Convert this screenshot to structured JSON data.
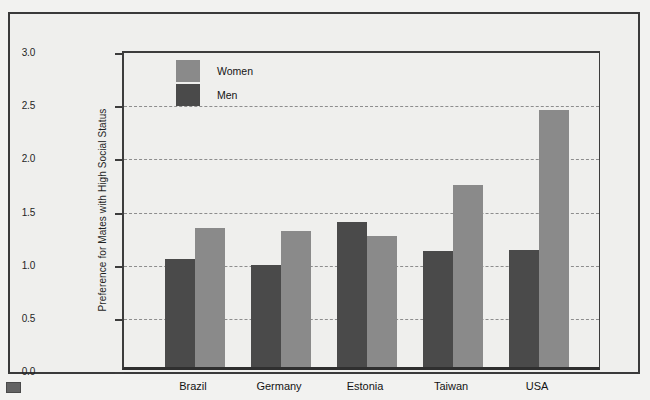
{
  "figure": {
    "caption_marker_name": "figure-caption-marker"
  },
  "legend": {
    "entries": [
      {
        "label": "Women",
        "color": "#8a8a8a"
      },
      {
        "label": "Men",
        "color": "#4a4a4a"
      }
    ]
  },
  "chart_data": {
    "type": "bar",
    "title": "",
    "subtitle": "",
    "xlabel": "",
    "ylabel": "Preference for Mates with High Social Status",
    "ylim": [
      0.0,
      3.0
    ],
    "ytick_labels": [
      "0.0",
      "0.5",
      "1.0",
      "1.5",
      "2.0",
      "2.5",
      "3.0"
    ],
    "ytick_values": [
      0.0,
      0.5,
      1.0,
      1.5,
      2.0,
      2.5,
      3.0
    ],
    "grid": true,
    "grid_axis": "y",
    "legend_position": "top-left-inside",
    "categories": [
      "Brazil",
      "Germany",
      "Estonia",
      "Taiwan",
      "USA"
    ],
    "series": [
      {
        "name": "Men",
        "color": "#4a4a4a",
        "values": [
          1.02,
          0.96,
          1.36,
          1.09,
          1.1
        ]
      },
      {
        "name": "Women",
        "color": "#8a8a8a",
        "values": [
          1.31,
          1.28,
          1.23,
          1.71,
          2.42
        ]
      }
    ]
  }
}
